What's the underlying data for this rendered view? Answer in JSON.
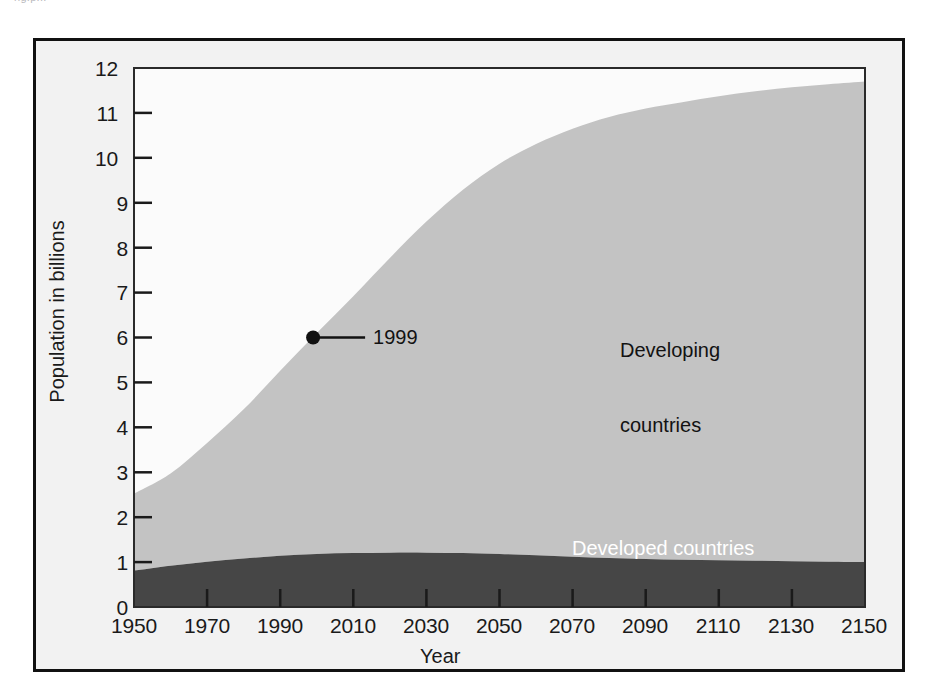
{
  "figure": {
    "caption_fragment": "ng.p...",
    "background_color": "#f2f2f2",
    "frame_color": "#111111",
    "plot_background": "#fbfbfb"
  },
  "chart_data": {
    "type": "area",
    "stacked": true,
    "title": "",
    "subtitle": "",
    "xlabel": "Year",
    "ylabel": "Population in billions",
    "xlim": [
      1950,
      2150
    ],
    "ylim": [
      0,
      12
    ],
    "xticks": [
      1950,
      1970,
      1990,
      2010,
      2030,
      2050,
      2070,
      2090,
      2110,
      2130,
      2150
    ],
    "xtick_labels": [
      "1950",
      "1970",
      "1990",
      "2010",
      "2030",
      "2050",
      "2070",
      "2090",
      "2110",
      "2130",
      "2150"
    ],
    "yticks": [
      0,
      1,
      2,
      3,
      4,
      5,
      6,
      7,
      8,
      9,
      10,
      11,
      12
    ],
    "ytick_labels": [
      "0",
      "1",
      "2",
      "3",
      "4",
      "5",
      "6",
      "7",
      "8",
      "9",
      "10",
      "11",
      "12"
    ],
    "grid": false,
    "legend_position": "inline-labels",
    "x": [
      1950,
      1960,
      1970,
      1980,
      1990,
      2000,
      2010,
      2020,
      2030,
      2040,
      2050,
      2060,
      2070,
      2080,
      2090,
      2100,
      2110,
      2120,
      2130,
      2140,
      2150
    ],
    "series": [
      {
        "name": "Developed countries",
        "color": "#464646",
        "label_color": "#ffffff",
        "values": [
          0.81,
          0.92,
          1.01,
          1.08,
          1.14,
          1.18,
          1.2,
          1.21,
          1.21,
          1.2,
          1.18,
          1.15,
          1.12,
          1.09,
          1.07,
          1.05,
          1.04,
          1.03,
          1.02,
          1.01,
          1.0
        ]
      },
      {
        "name": "Developing countries",
        "color": "#c3c3c3",
        "label_color": "#121212",
        "values": [
          1.71,
          2.05,
          2.64,
          3.32,
          4.12,
          4.92,
          5.72,
          6.56,
          7.37,
          8.09,
          8.69,
          9.16,
          9.53,
          9.82,
          10.03,
          10.19,
          10.33,
          10.45,
          10.55,
          10.63,
          10.7
        ]
      }
    ],
    "totals": [
      2.52,
      2.97,
      3.65,
      4.4,
      5.26,
      6.1,
      6.92,
      7.77,
      8.58,
      9.29,
      9.87,
      10.31,
      10.65,
      10.91,
      11.1,
      11.24,
      11.37,
      11.48,
      11.57,
      11.64,
      11.7
    ],
    "annotations": [
      {
        "name": "milestone-1999",
        "label": "1999",
        "x": 1999,
        "y": 6.0,
        "marker": "filled-circle",
        "marker_color": "#111111",
        "leader_line": true
      }
    ]
  },
  "labels": {
    "developing_line1": "Developing",
    "developing_line2": "countries",
    "developed": "Developed countries"
  }
}
